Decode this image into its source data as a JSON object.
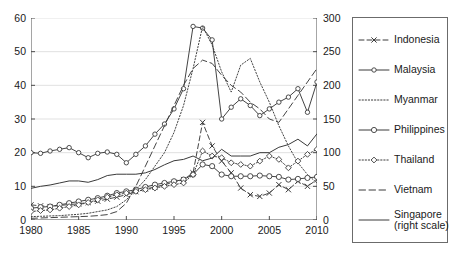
{
  "chart_data": {
    "type": "line",
    "title": "",
    "xlabel": "",
    "ylabel": "",
    "y2label": "",
    "x": [
      1980,
      1981,
      1982,
      1983,
      1984,
      1985,
      1986,
      1987,
      1988,
      1989,
      1990,
      1991,
      1992,
      1993,
      1994,
      1995,
      1996,
      1997,
      1998,
      1999,
      2000,
      2001,
      2002,
      2003,
      2004,
      2005,
      2006,
      2007,
      2008,
      2009,
      2010
    ],
    "xlim": [
      1980,
      2010
    ],
    "ylim": [
      0,
      60
    ],
    "y2lim": [
      0,
      300
    ],
    "xticks": [
      1980,
      1985,
      1990,
      1995,
      2000,
      2005,
      2010
    ],
    "yticks": [
      0,
      10,
      20,
      30,
      40,
      50,
      60
    ],
    "y2ticks": [
      0,
      50,
      100,
      150,
      200,
      250,
      300
    ],
    "grid": true,
    "legend_position": "right-outside",
    "series": [
      {
        "name": "Indonesia",
        "axis": "left",
        "style": "dashed",
        "marker": "cross",
        "values": [
          4.5,
          4.2,
          4.0,
          4.3,
          4.6,
          4.8,
          5.2,
          5.6,
          6.2,
          6.8,
          7.5,
          8.4,
          9.2,
          9.8,
          10.5,
          11.2,
          12.0,
          14.0,
          29.0,
          22.0,
          17.5,
          14.0,
          9.5,
          7.5,
          7.0,
          8.0,
          10.5,
          9.0,
          11.5,
          10.0,
          12.0
        ]
      },
      {
        "name": "Malaysia",
        "axis": "left",
        "style": "solid",
        "marker": "circle-small",
        "values": [
          20.0,
          19.8,
          20.5,
          21.0,
          21.5,
          20.0,
          18.5,
          19.8,
          20.2,
          19.5,
          17.0,
          19.5,
          22.0,
          25.5,
          28.5,
          33.0,
          39.0,
          57.5,
          57.0,
          53.5,
          30.0,
          33.5,
          36.0,
          34.0,
          31.0,
          33.0,
          35.0,
          36.5,
          39.0,
          32.0,
          41.0
        ]
      },
      {
        "name": "Myanmar",
        "axis": "left",
        "style": "dotted",
        "marker": "none",
        "values": [
          1.0,
          1.1,
          1.2,
          1.3,
          1.5,
          1.7,
          2.0,
          2.5,
          3.0,
          4.0,
          6.0,
          9.0,
          12.0,
          16.0,
          20.0,
          26.0,
          34.0,
          45.0,
          57.5,
          52.0,
          44.0,
          38.0,
          46.0,
          48.0,
          41.0,
          35.0,
          28.0,
          22.0,
          17.0,
          13.5,
          11.0
        ]
      },
      {
        "name": "Philippines",
        "axis": "left",
        "style": "solid",
        "marker": "circle",
        "values": [
          3.5,
          3.8,
          4.0,
          4.5,
          5.0,
          5.5,
          6.0,
          6.5,
          7.2,
          8.0,
          8.5,
          9.0,
          9.8,
          10.5,
          11.0,
          11.5,
          12.0,
          13.5,
          16.5,
          16.0,
          13.5,
          13.0,
          13.0,
          13.0,
          13.2,
          13.0,
          12.8,
          12.0,
          12.2,
          12.5,
          12.8
        ]
      },
      {
        "name": "Thailand",
        "axis": "left",
        "style": "dotted",
        "marker": "diamond",
        "values": [
          2.5,
          2.8,
          3.0,
          3.5,
          4.0,
          4.5,
          5.2,
          6.0,
          6.8,
          7.5,
          8.0,
          8.5,
          9.0,
          9.5,
          10.0,
          10.5,
          11.0,
          13.5,
          20.5,
          19.0,
          18.5,
          17.0,
          16.5,
          16.0,
          17.5,
          19.0,
          18.0,
          15.5,
          17.5,
          19.5,
          21.0
        ]
      },
      {
        "name": "Vietnam",
        "axis": "left",
        "style": "dashed-long",
        "marker": "none",
        "values": [
          0.5,
          0.6,
          0.7,
          0.8,
          0.9,
          1.0,
          1.1,
          1.3,
          1.6,
          2.5,
          5.0,
          10.0,
          16.0,
          22.0,
          28.0,
          34.0,
          40.0,
          45.0,
          47.5,
          46.5,
          43.0,
          40.0,
          38.0,
          35.0,
          33.0,
          30.0,
          29.0,
          33.0,
          37.0,
          41.0,
          45.0
        ]
      },
      {
        "name": "Singapore (right scale)",
        "axis": "right",
        "style": "solid",
        "marker": "none",
        "values": [
          47,
          50,
          52,
          55,
          58,
          58,
          56,
          60,
          66,
          68,
          68,
          68,
          70,
          75,
          82,
          88,
          90,
          95,
          88,
          92,
          105,
          95,
          95,
          95,
          100,
          100,
          108,
          112,
          120,
          110,
          128
        ]
      }
    ]
  },
  "legend": {
    "items": [
      {
        "label": "Indonesia",
        "style": "dashed",
        "marker": "cross"
      },
      {
        "label": "Malaysia",
        "style": "solid",
        "marker": "circle-small"
      },
      {
        "label": "Myanmar",
        "style": "dotted",
        "marker": "none"
      },
      {
        "label": "Philippines",
        "style": "solid",
        "marker": "circle"
      },
      {
        "label": "Thailand",
        "style": "dotted",
        "marker": "diamond"
      },
      {
        "label": "Vietnam",
        "style": "dashed-long",
        "marker": "none"
      },
      {
        "label": "Singapore",
        "label2": "(right scale)",
        "style": "solid",
        "marker": "none"
      }
    ]
  },
  "axes": {
    "left_ticks": [
      "0",
      "10",
      "20",
      "30",
      "40",
      "50",
      "60"
    ],
    "right_ticks": [
      "0",
      "50",
      "100",
      "150",
      "200",
      "250",
      "300"
    ],
    "x_ticks": [
      "1980",
      "1985",
      "1990",
      "1995",
      "2000",
      "2005",
      "2010"
    ]
  },
  "colors": {
    "line": "#3a3a3a",
    "grid": "#d9d9d9",
    "axis": "#4d4d4d",
    "text": "#1a1a1a",
    "background": "#ffffff"
  }
}
